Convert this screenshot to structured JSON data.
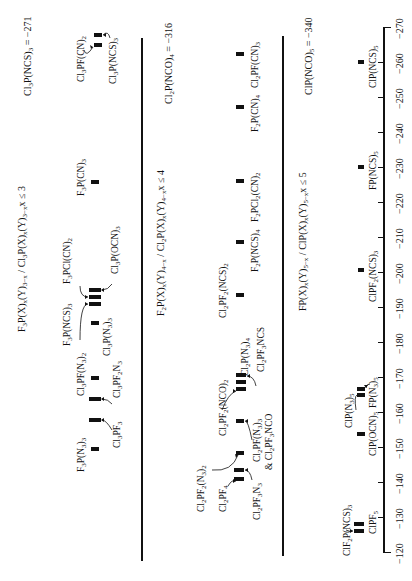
{
  "chart_data": {
    "type": "bar",
    "subtype": "stick-spectrum",
    "orientation": "rotated-90-ccw",
    "title": "",
    "xlabel": "",
    "ylabel": "",
    "axis": {
      "range": [
        -120,
        -270
      ],
      "ticks": [
        -120,
        -130,
        -140,
        -150,
        -160,
        -170,
        -180,
        -190,
        -200,
        -210,
        -220,
        -230,
        -240,
        -250,
        -260,
        -270
      ],
      "tick_labels": [
        "−120",
        "−130",
        "−140",
        "−150",
        "−160",
        "−170",
        "−180",
        "−190",
        "−200",
        "−210",
        "−220",
        "−230",
        "−240",
        "−250",
        "−260",
        "−270"
      ]
    },
    "grid": false,
    "panels": [
      {
        "title": "F3P(X)x(Y)3−x / Cl3P(X)x(Y)3−x x ≤ 3",
        "reference": "Cl3P(NCS)3 = −271",
        "series": [
          {
            "name": "F3P(N3)3",
            "value": -150
          },
          {
            "name": "Cl3PF3",
            "value": -158
          },
          {
            "name": "Cl3PF2N3",
            "value": -164
          },
          {
            "name": "Cl3PF(N3)2",
            "value": -170
          },
          {
            "name": "Cl3P(N3)3",
            "value": -186
          },
          {
            "name": "F3P(NCS)3",
            "value": -191
          },
          {
            "name": "F3PCl(CN)2",
            "value": -193
          },
          {
            "name": "Cl3P(OCN)3",
            "value": -194
          },
          {
            "name": "F3P(CN)3",
            "value": -226
          },
          {
            "name": "Cl3PF(CN)2",
            "value": -265
          },
          {
            "name": "Cl3P(NCS)3",
            "value": -268
          }
        ]
      },
      {
        "title": "F2P(X)x(Y)4−x / Cl2P(X)x(Y)4−x x ≤ 4",
        "reference": "Cl2P(NCO)4 = −316",
        "series": [
          {
            "name": "Cl2PF4",
            "value": -141
          },
          {
            "name": "Cl2PF3N3",
            "value": -144
          },
          {
            "name": "Cl2PF2(N3)2",
            "value": -149
          },
          {
            "name": "Cl2PF(N3)3 & Cl2PF3NCO",
            "value": -158
          },
          {
            "name": "Cl2PF2(NCO)2",
            "value": -167
          },
          {
            "name": "Cl2P(N3)4",
            "value": -169
          },
          {
            "name": "Cl2PF3NCS",
            "value": -170
          },
          {
            "name": "Cl2PF2(NCS)2",
            "value": -194
          },
          {
            "name": "F2P(NCS)4",
            "value": -209
          },
          {
            "name": "F2PCl2(CN)2",
            "value": -226
          },
          {
            "name": "F2P(CN)4",
            "value": -247
          },
          {
            "name": "Cl2PF(CN)3",
            "value": -263
          }
        ]
      },
      {
        "title": "FP(X)x(Y)5−x / ClP(X)x(Y)5−x x ≤ 5",
        "reference": "ClP(NCO)5 = −340",
        "series": [
          {
            "name": "ClF2P(NCS)3",
            "value": -127
          },
          {
            "name": "ClPF5",
            "value": -129
          },
          {
            "name": "ClP(OCN)5",
            "value": -154
          },
          {
            "name": "ClP(N3)5",
            "value": -166
          },
          {
            "name": "FP(N3)5",
            "value": -167
          },
          {
            "name": "ClPF2(NCS)3",
            "value": -201
          },
          {
            "name": "FP(NCS)5",
            "value": -231
          },
          {
            "name": "ClP(NCS)5",
            "value": -260
          }
        ]
      }
    ]
  },
  "panels": {
    "p1": {
      "title": "F3P(X)x(Y)3−x / Cl3P(X)x(Y)3−x x ≤ 3",
      "ref": "Cl3P(NCS)3 = −271"
    },
    "p2": {
      "title": "F2P(X)x(Y)4−x / Cl2P(X)x(Y)4−x x ≤ 4",
      "ref": "Cl2P(NCO)4 = −316"
    },
    "p3": {
      "title": "FP(X)x(Y)5−x / ClP(X)x(Y)5−x x ≤ 5",
      "ref": "ClP(NCO)5 = −340"
    }
  },
  "colors": {
    "ink": "#111111",
    "background": "#ffffff"
  }
}
